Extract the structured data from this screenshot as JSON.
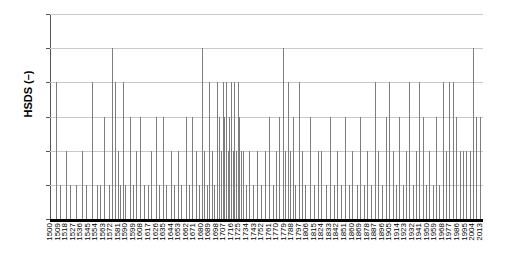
{
  "chart_data": {
    "type": "bar",
    "title": "",
    "subtitle": "",
    "xlabel": "",
    "ylabel": "HSDS (–)",
    "ylim": [
      0,
      6
    ],
    "yticks": [
      0,
      1,
      2,
      3,
      4,
      5,
      6
    ],
    "grid": true,
    "legend": null,
    "legend_position": "none",
    "bar_color": "#7d7d7d",
    "axis_color": "#000000",
    "gridline_color": "#c9c9c9",
    "x_tick_step": 9,
    "x_tick_labels": [
      "1500",
      "1509",
      "1518",
      "1527",
      "1536",
      "1545",
      "1554",
      "1563",
      "1572",
      "1581",
      "1590",
      "1599",
      "1608",
      "1617",
      "1626",
      "1635",
      "1644",
      "1653",
      "1662",
      "1671",
      "1680",
      "1689",
      "1698",
      "1707",
      "1716",
      "1725",
      "1734",
      "1743",
      "1752",
      "1761",
      "1770",
      "1779",
      "1788",
      "1797",
      "1806",
      "1815",
      "1824",
      "1833",
      "1842",
      "1851",
      "1860",
      "1869",
      "1878",
      "1887",
      "1896",
      "1905",
      "1914",
      "1923",
      "1932",
      "1941",
      "1950",
      "1959",
      "1968",
      "1977",
      "1986",
      "1995",
      "2004",
      "2013"
    ],
    "x_range": [
      1500,
      2017
    ],
    "categories": [
      1507,
      1512,
      1519,
      1524,
      1531,
      1538,
      1543,
      1550,
      1556,
      1560,
      1565,
      1570,
      1574,
      1578,
      1581,
      1584,
      1587,
      1590,
      1595,
      1599,
      1603,
      1608,
      1612,
      1617,
      1621,
      1626,
      1630,
      1635,
      1639,
      1644,
      1648,
      1653,
      1657,
      1662,
      1666,
      1670,
      1674,
      1678,
      1681,
      1684,
      1687,
      1690,
      1693,
      1696,
      1699,
      1702,
      1704,
      1706,
      1708,
      1710,
      1712,
      1714,
      1716,
      1718,
      1720,
      1722,
      1724,
      1726,
      1728,
      1731,
      1734,
      1738,
      1742,
      1747,
      1752,
      1757,
      1761,
      1766,
      1770,
      1774,
      1778,
      1781,
      1784,
      1787,
      1790,
      1793,
      1797,
      1801,
      1805,
      1810,
      1815,
      1820,
      1824,
      1829,
      1834,
      1839,
      1843,
      1848,
      1852,
      1857,
      1861,
      1866,
      1870,
      1875,
      1879,
      1883,
      1888,
      1892,
      1897,
      1901,
      1905,
      1909,
      1913,
      1917,
      1921,
      1925,
      1929,
      1933,
      1937,
      1941,
      1945,
      1949,
      1953,
      1957,
      1961,
      1965,
      1969,
      1973,
      1977,
      1981,
      1985,
      1989,
      1993,
      1997,
      2001,
      2005,
      2009,
      2013
    ],
    "values": [
      4,
      1,
      2,
      1,
      1,
      2,
      1,
      4,
      1,
      1,
      3,
      1,
      5,
      4,
      2,
      1,
      4,
      1,
      3,
      1,
      2,
      3,
      1,
      1,
      2,
      3,
      1,
      3,
      1,
      2,
      1,
      2,
      1,
      3,
      1,
      3,
      2,
      1,
      5,
      2,
      1,
      4,
      2,
      1,
      4,
      3,
      2,
      4,
      3,
      4,
      2,
      3,
      4,
      2,
      4,
      2,
      4,
      3,
      2,
      2,
      1,
      2,
      1,
      2,
      1,
      2,
      3,
      1,
      2,
      3,
      5,
      2,
      4,
      2,
      3,
      1,
      4,
      2,
      1,
      3,
      1,
      2,
      2,
      1,
      3,
      1,
      2,
      1,
      3,
      1,
      2,
      1,
      3,
      1,
      2,
      1,
      4,
      2,
      1,
      3,
      4,
      2,
      1,
      3,
      1,
      2,
      4,
      1,
      2,
      4,
      3,
      1,
      2,
      1,
      3,
      1,
      4,
      2,
      4,
      4,
      3,
      2,
      2,
      2,
      2,
      5,
      3,
      3
    ]
  }
}
